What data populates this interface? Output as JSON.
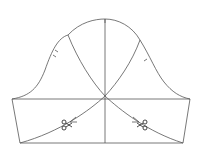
{
  "diagram": {
    "type": "sewing-pattern",
    "colors": {
      "line": "#555555",
      "background": "#ffffff"
    },
    "elements": {
      "sleeve_cap_curve": "cap curve from left underarm to top to right underarm",
      "underarm_line": "horizontal bicep line",
      "center_grainline": "vertical center line",
      "left_slash_line": "curved cutting line with scissors",
      "right_slash_line": "curved cutting line with scissors",
      "front_notch": "single notch",
      "back_notch": "double notch",
      "icons": [
        "scissors-icon",
        "scissors-icon"
      ]
    }
  }
}
